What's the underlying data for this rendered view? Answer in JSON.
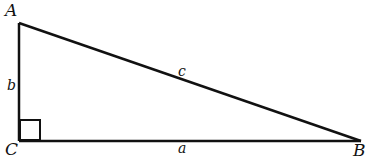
{
  "diagram": {
    "vertices": {
      "A": {
        "label": "A"
      },
      "B": {
        "label": "B"
      },
      "C": {
        "label": "C"
      }
    },
    "sides": {
      "a": {
        "label": "a",
        "between": "C-B"
      },
      "b": {
        "label": "b",
        "between": "A-C"
      },
      "c": {
        "label": "c",
        "between": "A-B"
      }
    },
    "right_angle_at": "C",
    "stroke_color": "#111111"
  }
}
